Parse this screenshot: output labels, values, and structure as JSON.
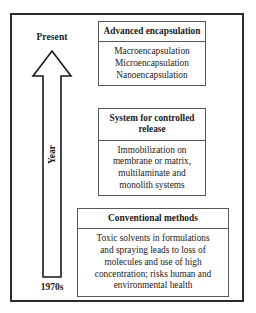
{
  "figure": {
    "type": "timeline-diagram",
    "axis": {
      "name": "Year",
      "top_label": "Present",
      "bottom_label": "1970s",
      "direction": "upward",
      "arrow_icon": "up-arrow-icon"
    },
    "boxes": [
      {
        "id": "advanced",
        "header": "Advanced encapsulation",
        "header_lines": [
          "Advanced",
          "encapsulation"
        ],
        "body_lines": [
          "Macroencapsulation",
          "Microencapsulation",
          "Nanoencapsulation"
        ]
      },
      {
        "id": "controlled",
        "header": "System for controlled release",
        "header_lines": [
          "System for",
          "controlled release"
        ],
        "body_lines": [
          "Immobilization on",
          "membrane or matrix,",
          "multilaminate and",
          "monolith systems"
        ]
      },
      {
        "id": "conventional",
        "header": "Conventional methods",
        "header_lines": [
          "Conventional methods"
        ],
        "body_lines": [
          "Toxic solvents in formulations",
          "and spraying leads to loss of",
          "molecules and use of high",
          "concentration; risks human and",
          "environmental health"
        ]
      }
    ],
    "colors": {
      "frame_border": "#2b2b2b",
      "box_border": "#595959",
      "text": "#1a1a1a",
      "background": "#ffffff"
    }
  }
}
